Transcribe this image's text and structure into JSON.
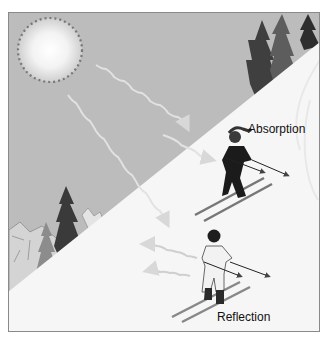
{
  "figure": {
    "labels": {
      "absorption": "Absorption",
      "reflection": "Reflection"
    },
    "elements": {
      "sun": "sun-icon",
      "slope": "snow-slope",
      "trees": "pine-trees",
      "mountains": "mountain-range",
      "skier_absorption": "skier-dark-clothing",
      "skier_reflection": "skier-light-clothing"
    },
    "colors": {
      "sky": "#b9b9b9",
      "snow": "#f7f7f7",
      "ray": "#e6e6e6",
      "dark_clothing": "#1a1a1a",
      "light_clothing": "#f2f2f2",
      "tree_dark": "#3a3a3a",
      "tree_mid": "#6a6a6a"
    }
  }
}
